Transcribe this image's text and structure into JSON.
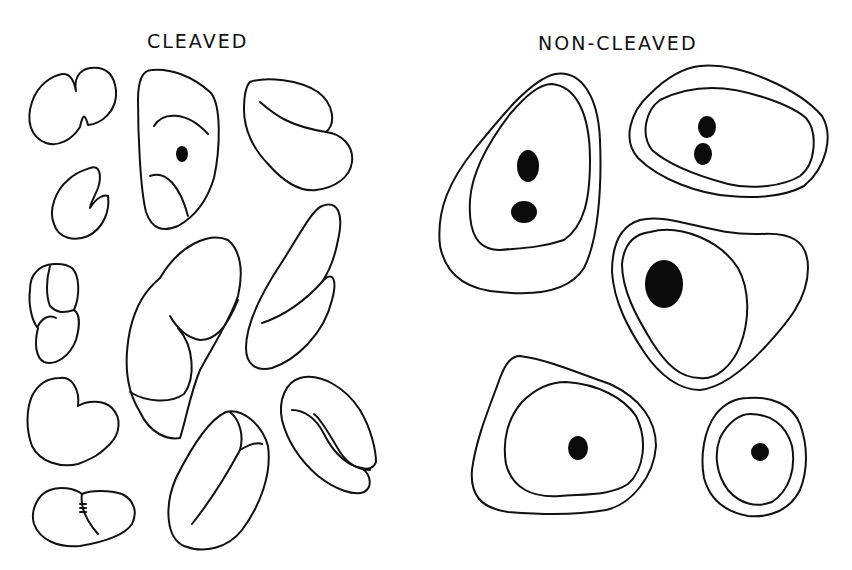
{
  "figure": {
    "panels": [
      {
        "id": "cleaved",
        "title": "CLEAVED",
        "cell_count": 12,
        "description": "Cells with cleaved/indented irregular nuclei outlines"
      },
      {
        "id": "non_cleaved",
        "title": "NON-CLEAVED",
        "cell_count": 5,
        "description": "Round to oval cells with double outline and dark nucleoli"
      }
    ],
    "colors": {
      "line": "#111111",
      "background": "#ffffff",
      "nucleolus": "#0a0a0a"
    }
  }
}
